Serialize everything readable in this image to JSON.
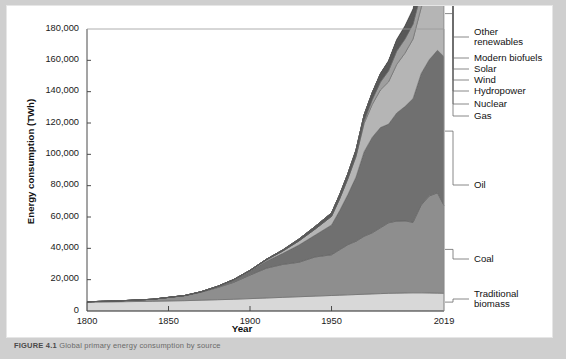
{
  "figure": {
    "caption_label": "FIGURE 4.1",
    "caption_rest": "Global primary energy consumption by source"
  },
  "chart_data": {
    "type": "area",
    "stacked": true,
    "title": "",
    "xlabel": "Year",
    "ylabel": "Energy consumption (TWh)",
    "xlim": [
      1800,
      2019
    ],
    "ylim": [
      0,
      180000
    ],
    "xticks": [
      1800,
      1850,
      1900,
      1950,
      2019
    ],
    "xticklabels": [
      "1800",
      "1850",
      "1900",
      "1950",
      "2019"
    ],
    "yticks": [
      0,
      20000,
      40000,
      60000,
      80000,
      100000,
      120000,
      140000,
      160000,
      180000
    ],
    "yticklabels": [
      "0",
      "20,000",
      "40,000",
      "60,000",
      "80,000",
      "100,000",
      "120,000",
      "140,000",
      "160,000",
      "180,000"
    ],
    "grid": false,
    "legend_position": "right-outside",
    "x": [
      1800,
      1820,
      1840,
      1860,
      1870,
      1880,
      1890,
      1900,
      1910,
      1920,
      1930,
      1940,
      1950,
      1955,
      1960,
      1965,
      1970,
      1975,
      1980,
      1985,
      1990,
      1995,
      2000,
      2005,
      2010,
      2015,
      2019
    ],
    "series": [
      {
        "name": "Traditional biomass",
        "color": "#d8d8d8",
        "values": [
          5600,
          5900,
          6200,
          6600,
          6900,
          7200,
          7500,
          7900,
          8300,
          8700,
          9100,
          9500,
          9900,
          10100,
          10300,
          10500,
          10700,
          10900,
          11100,
          11300,
          11400,
          11500,
          11600,
          11600,
          11500,
          11400,
          11300
        ]
      },
      {
        "name": "Coal",
        "color": "#8e8e8e",
        "values": [
          300,
          600,
          1300,
          3200,
          5100,
          7700,
          10800,
          15000,
          19000,
          21000,
          22000,
          25000,
          26000,
          29000,
          32000,
          34000,
          37000,
          39000,
          42000,
          45000,
          46000,
          46000,
          45000,
          56000,
          62000,
          64000,
          56000
        ]
      },
      {
        "name": "Oil",
        "color": "#707070",
        "values": [
          0,
          0,
          0,
          100,
          300,
          700,
          1500,
          2500,
          4500,
          7000,
          11000,
          14000,
          19000,
          25000,
          32000,
          41000,
          54000,
          61000,
          64000,
          63000,
          69000,
          73000,
          79000,
          84000,
          87000,
          91000,
          95000
        ]
      },
      {
        "name": "Gas",
        "color": "#b5b5b5",
        "values": [
          0,
          0,
          0,
          0,
          0,
          100,
          200,
          400,
          800,
          1500,
          2600,
          3800,
          5500,
          7500,
          10000,
          13000,
          18000,
          21000,
          24000,
          27000,
          31000,
          34000,
          38000,
          42000,
          47000,
          51000,
          55000
        ]
      },
      {
        "name": "Nuclear",
        "color": "#9f9f9f",
        "values": [
          0,
          0,
          0,
          0,
          0,
          0,
          0,
          0,
          0,
          0,
          0,
          0,
          0,
          100,
          300,
          700,
          1500,
          3000,
          5000,
          7000,
          8500,
          9000,
          9500,
          9600,
          9300,
          9000,
          9300
        ]
      },
      {
        "name": "Hydropower",
        "color": "#585858",
        "values": [
          0,
          0,
          0,
          0,
          0,
          0,
          100,
          200,
          400,
          700,
          1200,
          1700,
          2200,
          2600,
          3000,
          3500,
          4000,
          4500,
          5200,
          5900,
          6500,
          7100,
          7600,
          8200,
          9100,
          9900,
          10400
        ]
      },
      {
        "name": "Wind",
        "color": "#3a3a3a",
        "values": [
          0,
          0,
          0,
          0,
          0,
          0,
          0,
          0,
          0,
          0,
          0,
          0,
          0,
          0,
          0,
          0,
          0,
          0,
          0,
          50,
          100,
          200,
          500,
          1000,
          2000,
          3400,
          4200
        ]
      },
      {
        "name": "Solar",
        "color": "#6d6d6d",
        "values": [
          0,
          0,
          0,
          0,
          0,
          0,
          0,
          0,
          0,
          0,
          0,
          0,
          0,
          0,
          0,
          0,
          0,
          0,
          0,
          0,
          0,
          50,
          100,
          200,
          500,
          1300,
          2300
        ]
      },
      {
        "name": "Modern biofuels",
        "color": "#4a4a4a",
        "values": [
          0,
          0,
          0,
          0,
          0,
          0,
          0,
          0,
          0,
          0,
          0,
          0,
          0,
          0,
          0,
          0,
          0,
          50,
          100,
          200,
          300,
          400,
          600,
          800,
          1000,
          1100,
          1200
        ]
      },
      {
        "name": "Other renewables",
        "color": "#2b2b2b",
        "values": [
          0,
          0,
          0,
          0,
          0,
          0,
          0,
          0,
          0,
          0,
          0,
          0,
          0,
          0,
          0,
          50,
          100,
          200,
          300,
          450,
          600,
          800,
          1000,
          1200,
          1500,
          1800,
          2100
        ]
      }
    ],
    "legend": [
      {
        "label_line1": "Other",
        "label_line2": "renewables",
        "series": "Other renewables"
      },
      {
        "label_line1": "Modern biofuels",
        "label_line2": "",
        "series": "Modern biofuels"
      },
      {
        "label_line1": "Solar",
        "label_line2": "",
        "series": "Solar"
      },
      {
        "label_line1": "Wind",
        "label_line2": "",
        "series": "Wind"
      },
      {
        "label_line1": "Hydropower",
        "label_line2": "",
        "series": "Hydropower"
      },
      {
        "label_line1": "Nuclear",
        "label_line2": "",
        "series": "Nuclear"
      },
      {
        "label_line1": "Gas",
        "label_line2": "",
        "series": "Gas"
      },
      {
        "label_line1": "Oil",
        "label_line2": "",
        "series": "Oil"
      },
      {
        "label_line1": "Coal",
        "label_line2": "",
        "series": "Coal"
      },
      {
        "label_line1": "Traditional",
        "label_line2": "biomass",
        "series": "Traditional biomass"
      }
    ]
  }
}
